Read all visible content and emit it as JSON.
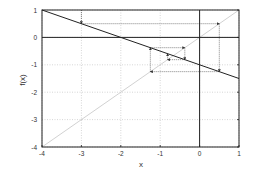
{
  "chart_data": {
    "type": "line",
    "title": "",
    "xlabel": "x",
    "ylabel": "f(x)",
    "xlim": [
      -4,
      1
    ],
    "ylim": [
      -4,
      1
    ],
    "xticks": [
      -4,
      -3,
      -2,
      -1,
      0,
      1
    ],
    "yticks": [
      -4,
      -3,
      -2,
      -1,
      0,
      1
    ],
    "xtick_labels": [
      "-4",
      "-3",
      "-2",
      "-1",
      "0",
      "1"
    ],
    "ytick_labels": [
      "-4",
      "-3",
      "-2",
      "-1",
      "0",
      "1"
    ],
    "grid": true,
    "legend": null,
    "series": [
      {
        "name": "f(x) = -0.5x - 1",
        "x": [
          -4,
          1
        ],
        "y": [
          1,
          -1.5
        ],
        "color": "#222222",
        "style": "solid"
      },
      {
        "name": "y = x",
        "x": [
          -4,
          1
        ],
        "y": [
          -4,
          1
        ],
        "color": "#cccccc",
        "style": "solid"
      },
      {
        "name": "cobweb",
        "color": "#333333",
        "style": "dotted",
        "points": [
          [
            -3,
            1
          ],
          [
            -3,
            0.5
          ],
          [
            0.5,
            0.5
          ],
          [
            0.5,
            -1.25
          ],
          [
            -1.25,
            -1.25
          ],
          [
            -1.25,
            -0.375
          ],
          [
            -0.375,
            -0.375
          ],
          [
            -0.375,
            -0.8125
          ],
          [
            -0.8125,
            -0.8125
          ],
          [
            -0.8125,
            -0.59375
          ]
        ]
      }
    ],
    "annotations": [
      "Cobweb iteration converging to fixed point x* = -2/3"
    ]
  },
  "colors": {
    "axis": "#222222",
    "grid": "#bbbbbb",
    "function_line": "#222222",
    "identity_line": "#cccccc",
    "cobweb": "#333333"
  }
}
